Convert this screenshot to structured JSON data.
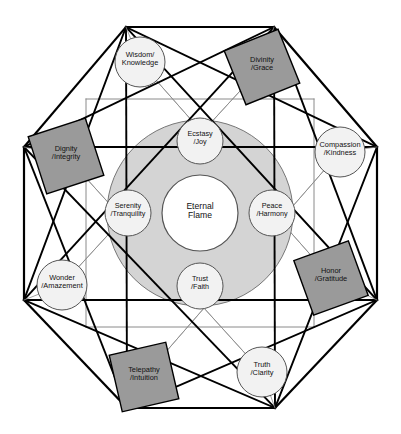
{
  "diagram": {
    "type": "concentric-octagon-network",
    "colors": {
      "background": "#ffffff",
      "outline": "#000000",
      "inner_grid_line": "#8a8a8a",
      "square_node_fill": "#9a9a9a",
      "square_node_stroke": "#000000",
      "circle_node_fill": "#f2f2f2",
      "circle_node_stroke": "#555555",
      "halo_fill": "#d4d4d4",
      "halo_stroke": "#777777",
      "core_fill": "#ffffff",
      "core_stroke": "#555555",
      "text": "#111111"
    },
    "center": {
      "label": "Eternal\nFlame",
      "name": "eternal-flame",
      "cx": 200,
      "cy": 213,
      "r": 38
    },
    "halo": {
      "name": "eternal-flame-halo",
      "cx": 200,
      "cy": 213,
      "r": 93
    },
    "inner_nodes": [
      {
        "name": "ecstasy-joy",
        "label": "Ecstasy\n/Joy",
        "cx": 200,
        "cy": 141,
        "r": 23,
        "shape": "circle"
      },
      {
        "name": "peace-harmony",
        "label": "Peace\n/Harmony",
        "cx": 272,
        "cy": 213,
        "r": 23,
        "shape": "circle"
      },
      {
        "name": "trust-faith",
        "label": "Trust\n/Faith",
        "cx": 200,
        "cy": 286,
        "r": 23,
        "shape": "circle"
      },
      {
        "name": "serenity-tranquility",
        "label": "Serenity\n/Tranquility",
        "cx": 128,
        "cy": 213,
        "r": 23,
        "shape": "circle"
      }
    ],
    "outer_nodes": [
      {
        "name": "wisdom-knowledge",
        "label": "Wisdom/\nKnowledge",
        "cx": 140,
        "cy": 62,
        "r": 25,
        "shape": "circle",
        "angle": 0
      },
      {
        "name": "divinity-grace",
        "label": "Divinity\n/Grace",
        "cx": 262,
        "cy": 67,
        "w": 58,
        "h": 58,
        "shape": "square",
        "angle": -22
      },
      {
        "name": "compassion-kindness",
        "label": "Compassion\n/Kindness",
        "cx": 340,
        "cy": 152,
        "r": 25,
        "shape": "circle",
        "angle": 0
      },
      {
        "name": "honor-gratitude",
        "label": "Honor\n/Gratitude",
        "cx": 331,
        "cy": 278,
        "w": 58,
        "h": 58,
        "shape": "square",
        "angle": -20
      },
      {
        "name": "truth-clarity",
        "label": "Truth\n/Clarity",
        "cx": 262,
        "cy": 372,
        "r": 25,
        "shape": "circle",
        "angle": 0
      },
      {
        "name": "telepathy-intuition",
        "label": "Telepathy\n/Intuition",
        "cx": 144,
        "cy": 377,
        "w": 58,
        "h": 58,
        "shape": "square",
        "angle": -13
      },
      {
        "name": "wonder-amazement",
        "label": "Wonder\n/Amazement",
        "cx": 62,
        "cy": 285,
        "r": 25,
        "shape": "circle",
        "angle": 0
      },
      {
        "name": "dignity-integrity",
        "label": "Dignity\n/Integrity",
        "cx": 66,
        "cy": 156,
        "w": 60,
        "h": 60,
        "shape": "square",
        "angle": -18
      }
    ],
    "octagon_vertices": [
      {
        "name": "vertex-top-left",
        "x": 126,
        "y": 27
      },
      {
        "name": "vertex-top-right",
        "x": 274,
        "y": 27
      },
      {
        "name": "vertex-right-top",
        "x": 377,
        "y": 147
      },
      {
        "name": "vertex-right-bottom",
        "x": 377,
        "y": 300
      },
      {
        "name": "vertex-bottom-right",
        "x": 275,
        "y": 408
      },
      {
        "name": "vertex-bottom-left",
        "x": 127,
        "y": 408
      },
      {
        "name": "vertex-left-bottom",
        "x": 24,
        "y": 300
      },
      {
        "name": "vertex-left-top",
        "x": 24,
        "y": 147
      }
    ],
    "inner_square_corners": [
      {
        "name": "inner-corner-tl",
        "x": 86,
        "y": 99
      },
      {
        "name": "inner-corner-tr",
        "x": 314,
        "y": 99
      },
      {
        "name": "inner-corner-br",
        "x": 314,
        "y": 327
      },
      {
        "name": "inner-corner-bl",
        "x": 86,
        "y": 327
      }
    ]
  }
}
